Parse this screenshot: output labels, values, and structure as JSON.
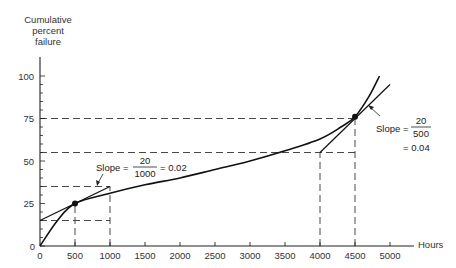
{
  "caption": "Figure — cumulative failure curve",
  "chart_data": {
    "type": "line",
    "title": "",
    "xlabel": "Hours",
    "ylabel": "Cumulative percent failure",
    "xlim": [
      0,
      5000
    ],
    "ylim": [
      0,
      100
    ],
    "x_ticks": [
      0,
      500,
      1000,
      1500,
      2000,
      2500,
      3000,
      3500,
      4000,
      4500,
      5000
    ],
    "y_ticks": [
      0,
      25,
      50,
      75,
      100
    ],
    "grid": false,
    "series": [
      {
        "name": "Cumulative failure curve",
        "x": [
          0,
          250,
          500,
          1000,
          1500,
          2000,
          2500,
          3000,
          3500,
          4000,
          4300,
          4500,
          4700,
          4850
        ],
        "values": [
          0,
          15,
          25,
          31,
          36,
          40,
          45,
          50,
          56,
          63,
          70,
          76,
          88,
          100
        ]
      },
      {
        "name": "Tangent at 500 h",
        "x": [
          0,
          1000
        ],
        "values": [
          15,
          35
        ]
      },
      {
        "name": "Tangent at 4500 h",
        "x": [
          4000,
          5000
        ],
        "values": [
          55,
          95
        ]
      }
    ],
    "points": [
      {
        "x": 500,
        "y": 25
      },
      {
        "x": 4500,
        "y": 76
      }
    ],
    "reference_lines": [
      {
        "type": "horizontal",
        "y": 15,
        "x_to": 1000
      },
      {
        "type": "horizontal",
        "y": 35,
        "x_to": 1000
      },
      {
        "type": "horizontal",
        "y": 55,
        "x_to": 4500
      },
      {
        "type": "horizontal",
        "y": 75,
        "x_to": 4500
      },
      {
        "type": "vertical",
        "x": 500
      },
      {
        "type": "vertical",
        "x": 1000
      },
      {
        "type": "vertical",
        "x": 4000
      },
      {
        "type": "vertical",
        "x": 4500
      }
    ],
    "annotations": [
      {
        "text": "Slope = 20/1000 = 0.02",
        "near": {
          "x": 1000,
          "y": 35
        }
      },
      {
        "text": "Slope = 20/500 = 0.04",
        "near": {
          "x": 4500,
          "y": 76
        }
      }
    ]
  },
  "labels": {
    "y_axis_title_line1": "Cumulative",
    "y_axis_title_line2": "percent",
    "y_axis_title_line3": "failure",
    "x_axis_title": "Hours",
    "slope1_prefix": "Slope =",
    "slope1_num": "20",
    "slope1_den": "1000",
    "slope1_result": "= 0.02",
    "slope2_prefix": "Slope =",
    "slope2_num": "20",
    "slope2_den": "500",
    "slope2_result": "= 0.04"
  }
}
